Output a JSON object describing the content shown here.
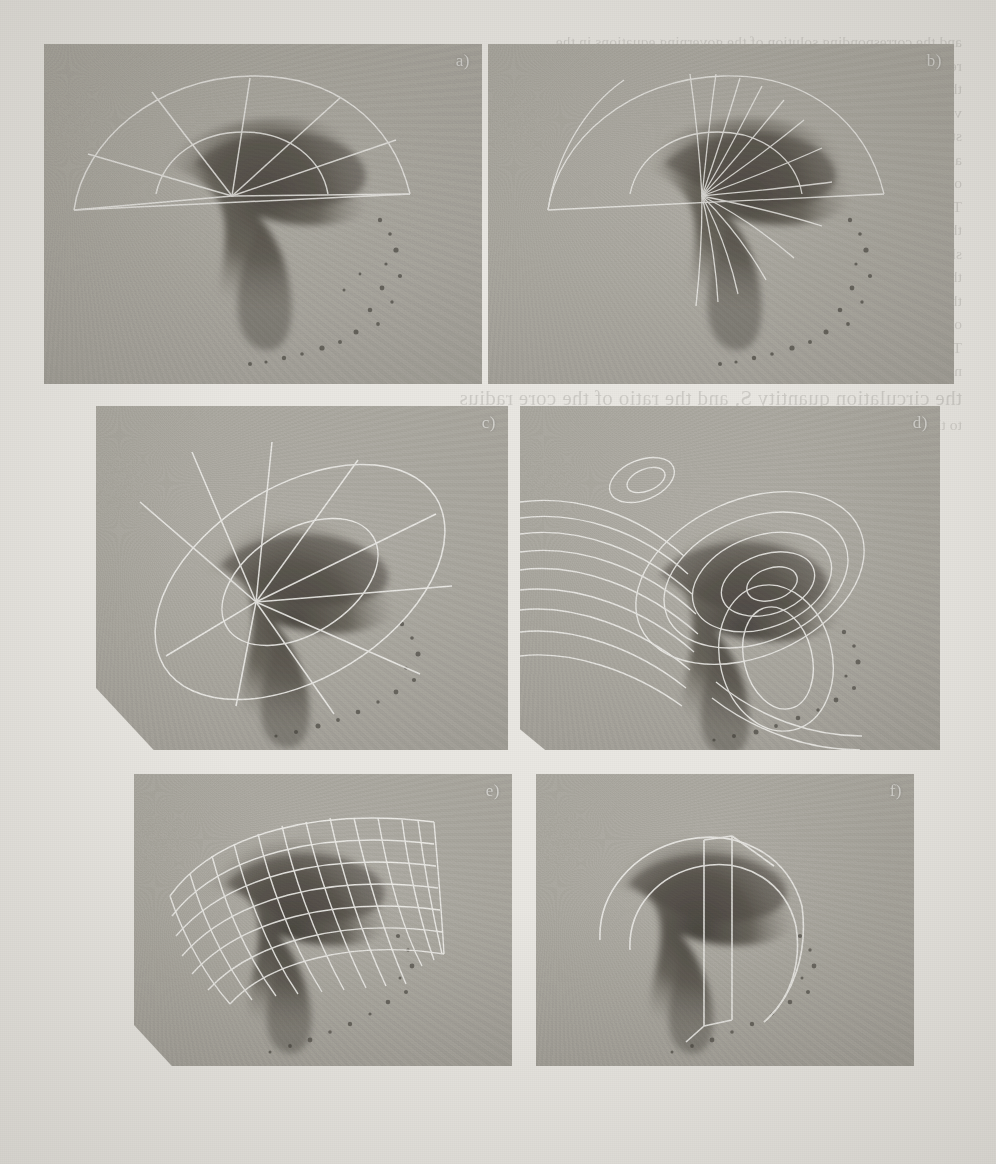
{
  "document": {
    "kind": "scanned-journal-figure",
    "page_background_color": "#e9e7e2",
    "ink_color": "#3a3730",
    "overlay_line_color": "#fbfaf6"
  },
  "figure": {
    "caption_visible": false,
    "rows": 3,
    "columns": 2,
    "panel_count": 6,
    "panels": [
      {
        "id": "a",
        "label": "a)",
        "overlay_name": "sector-grid",
        "overlay_description": "fan-shaped sector boundary with straight radial spokes converging at a hub",
        "radial_spokes": 7,
        "arc_rings": 2
      },
      {
        "id": "b",
        "label": "b)",
        "overlay_name": "streamline-rays",
        "overlay_description": "dense family of curved streamlines fanning out from the hub across the spiral",
        "streamline_count": 14,
        "arc_rings": 2
      },
      {
        "id": "c",
        "label": "c)",
        "overlay_name": "elliptical-radial-grid",
        "overlay_description": "tilted ellipse boundary with radial spokes from an off-centre hub",
        "radial_spokes": 9,
        "arc_rings": 2
      },
      {
        "id": "d",
        "label": "d)",
        "overlay_name": "contour-lines",
        "overlay_description": "nested closed contour loops around a vortex core with trailing open contours",
        "contour_levels": 11,
        "closed_loops": 5
      },
      {
        "id": "e",
        "label": "e)",
        "overlay_name": "curvilinear-mesh",
        "overlay_description": "body-fitted curvilinear quadrilateral computational mesh draped over the spiral",
        "mesh_rows": 7,
        "mesh_columns": 14
      },
      {
        "id": "f",
        "label": "f)",
        "overlay_name": "cut-plane-outline",
        "overlay_description": "sparse curved boundary outlines with a vertical cutting plane through the core",
        "outline_curves": 4,
        "cut_planes": 1
      }
    ]
  },
  "showthrough": {
    "note": "mirrored ink bleeding through from the reverse side of the scanned page; not primary content",
    "lines": [
      "and the corresponding solution of the governing equations in the",
      "region downstream of the nozzle exit plane is obtained from the",
      "the measured velocity field. The resulting distribution of the",
      "",
      "vorticity transport equation is integrated along the mean",
      "streamlines shown in the figure. The computed circulation",
      "agrees with the experimental values to within five percent",
      "over the whole range of Reynolds numbers investigated.",
      "",
      "The spiral structure of the shear layer is clearly visible in",
      "the photographs and the associated roll-up of the vortex",
      "sheet proceeds in a self-similar manner. A comparison of",
      "the measured and computed trajectories is presented in",
      "",
      "the following section, where the effect of the swirl number",
      "on the breakdown location is discussed in some detail.",
      "Three distinct regimes can be identified as the swirl",
      "number is increased beyond the critical value.",
      "",
      "the circulation quantity S, and the ratio of the core radius",
      "to the nozzle diameter. The numerical grid used for the"
    ]
  }
}
